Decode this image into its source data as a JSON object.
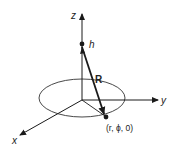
{
  "diagram": {
    "title": "",
    "axes": {
      "x_label": "x",
      "y_label": "y",
      "z_label": "z"
    },
    "points": {
      "height_label": "h",
      "field_point_label": "(r, ϕ, 0)"
    },
    "vector_label": "R",
    "colors": {
      "stroke": "#1a1a1a",
      "background": "#ffffff"
    }
  }
}
